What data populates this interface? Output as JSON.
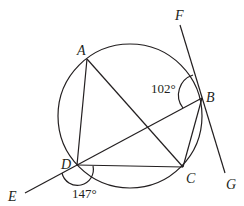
{
  "diagram": {
    "type": "circle-geometry",
    "circle": {
      "cx": 130,
      "cy": 116,
      "r": 72
    },
    "points": {
      "A": {
        "label": "A",
        "x": 87,
        "y": 59
      },
      "B": {
        "label": "B",
        "x": 202,
        "y": 98
      },
      "C": {
        "label": "C",
        "x": 183,
        "y": 167
      },
      "D": {
        "label": "D",
        "x": 77,
        "y": 165
      },
      "E": {
        "label": "E",
        "x": 25,
        "y": 193
      },
      "F": {
        "label": "F",
        "x": 180,
        "y": 25
      },
      "G": {
        "label": "G",
        "x": 225,
        "y": 173
      }
    },
    "segments": [
      "AD",
      "AC",
      "DC",
      "BC",
      "EB",
      "FG"
    ],
    "angles": [
      {
        "label": "102°",
        "vertex": "B",
        "between": [
          "F",
          "D"
        ]
      },
      {
        "label": "147°",
        "vertex": "D",
        "between": [
          "E",
          "C"
        ]
      }
    ],
    "colors": {
      "stroke": "#231f20",
      "background": "#ffffff"
    }
  }
}
